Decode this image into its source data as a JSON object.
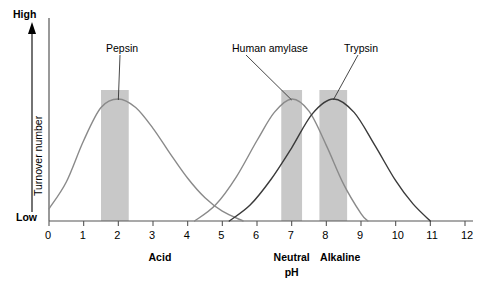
{
  "chart_data": {
    "type": "line",
    "title": "",
    "xlabel": "pH",
    "ylabel": "Turnover number",
    "xlim": [
      0,
      12
    ],
    "ylim": [
      0,
      1
    ],
    "grid": false,
    "legend_position": "inline-annotations",
    "xticks": [
      "0",
      "1",
      "2",
      "3",
      "4",
      "5",
      "6",
      "7",
      "8",
      "9",
      "10",
      "11",
      "12"
    ],
    "y_axis_endpoints": {
      "high": "High",
      "low": "Low"
    },
    "zone_labels": [
      {
        "text": "Acid",
        "ph": 3.2
      },
      {
        "text": "Neutral",
        "ph": 7.0
      },
      {
        "text": "pH",
        "ph": 7.0
      },
      {
        "text": "Alkaline",
        "ph": 8.4
      }
    ],
    "series": [
      {
        "name": "Pepsin",
        "color": "#8a8a8a",
        "optimum_ph": 2.0,
        "range_ph": [
          0.0,
          5.6
        ],
        "peak_value": 1.0,
        "optimum_band_ph": [
          1.5,
          2.3
        ],
        "points_ph": [
          0.0,
          0.5,
          1.0,
          1.5,
          2.0,
          2.5,
          3.0,
          3.5,
          4.0,
          4.5,
          5.0,
          5.6
        ],
        "points_value": [
          0.1,
          0.32,
          0.66,
          0.93,
          1.0,
          0.93,
          0.76,
          0.55,
          0.35,
          0.19,
          0.08,
          0.0
        ]
      },
      {
        "name": "Human amylase",
        "color": "#8a8a8a",
        "optimum_ph": 7.0,
        "range_ph": [
          4.2,
          9.2
        ],
        "peak_value": 1.0,
        "optimum_band_ph": [
          6.7,
          7.3
        ],
        "points_ph": [
          4.2,
          4.8,
          5.4,
          6.0,
          6.5,
          7.0,
          7.5,
          8.0,
          8.5,
          9.0,
          9.2
        ],
        "points_value": [
          0.0,
          0.13,
          0.36,
          0.66,
          0.89,
          1.0,
          0.9,
          0.62,
          0.3,
          0.06,
          0.0
        ]
      },
      {
        "name": "Trypsin",
        "color": "#3a3a3a",
        "optimum_ph": 8.2,
        "range_ph": [
          5.2,
          11.0
        ],
        "peak_value": 1.0,
        "optimum_band_ph": [
          7.8,
          8.6
        ],
        "points_ph": [
          5.2,
          5.8,
          6.4,
          7.0,
          7.6,
          8.2,
          8.8,
          9.4,
          10.0,
          10.5,
          11.0
        ],
        "points_value": [
          0.0,
          0.13,
          0.34,
          0.6,
          0.88,
          1.0,
          0.89,
          0.62,
          0.33,
          0.14,
          0.0
        ]
      }
    ],
    "optimum_bands": [
      {
        "series": "Pepsin",
        "ph_start": 1.5,
        "ph_end": 2.3,
        "color": "#c8c8c8"
      },
      {
        "series": "Human amylase",
        "ph_start": 6.7,
        "ph_end": 7.3,
        "color": "#c8c8c8"
      },
      {
        "series": "Trypsin",
        "ph_start": 7.8,
        "ph_end": 8.6,
        "color": "#c8c8c8"
      }
    ],
    "annotations": [
      {
        "text": "Pepsin",
        "label_x": 106,
        "label_y": 42,
        "target_ph": 2.0
      },
      {
        "text": "Human amylase",
        "label_x": 232,
        "label_y": 42,
        "target_ph": 7.0
      },
      {
        "text": "Trypsin",
        "label_x": 344,
        "label_y": 42,
        "target_ph": 8.2
      }
    ]
  }
}
